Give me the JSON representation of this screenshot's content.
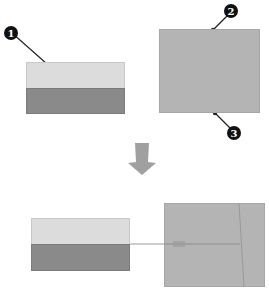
{
  "diagram": {
    "callouts": [
      {
        "id": 1,
        "label": "1"
      },
      {
        "id": 2,
        "label": "2"
      },
      {
        "id": 3,
        "label": "3"
      }
    ],
    "colors": {
      "light_band": "#dcdcdc",
      "dark_band": "#8a8a8a",
      "target_box": "#b4b4b4",
      "arrow": "#a0a0a0",
      "callout_fill": "#111111"
    },
    "steps": [
      {
        "name": "before",
        "description": "Two-tone source box and separate gray target box"
      },
      {
        "name": "after",
        "description": "Source box connected by guide line to target box"
      }
    ]
  }
}
